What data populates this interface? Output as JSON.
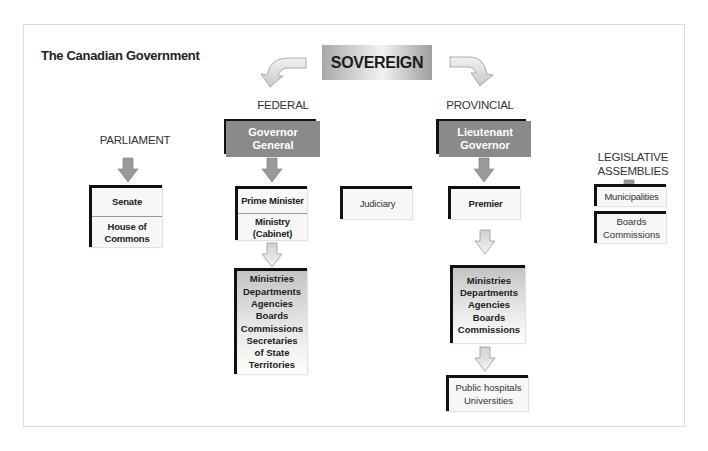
{
  "diagram": {
    "title": "The Canadian Government",
    "top": {
      "label": "SOVEREIGN"
    },
    "branches": {
      "federal": {
        "heading": "FEDERAL",
        "head_box": "Governor General",
        "head_box_lines": [
          "Governor",
          "General"
        ],
        "executive": {
          "top_cell": "Prime Minister",
          "bottom_cell_lines": [
            "Ministry",
            "(Cabinet)"
          ]
        },
        "administration": [
          "Ministries",
          "Departments",
          "Agencies",
          "Boards",
          "Commissions",
          "Secretaries",
          "of State",
          "Territories"
        ]
      },
      "parliament": {
        "heading": "PARLIAMENT",
        "top_cell": "Senate",
        "bottom_cell_lines": [
          "House of",
          "Commons"
        ]
      },
      "judiciary": {
        "label": "Judiciary"
      },
      "provincial": {
        "heading": "PROVINCIAL",
        "head_box_lines": [
          "Lieutenant",
          "Governor"
        ],
        "executive": {
          "label": "Premier"
        },
        "administration": [
          "Ministries",
          "Departments",
          "Agencies",
          "Boards",
          "Commissions"
        ],
        "institutions": [
          "Public hospitals",
          "Universities"
        ]
      },
      "legislative_assemblies": {
        "heading_lines": [
          "LEGISLATIVE",
          "ASSEMBLIES"
        ],
        "items": [
          {
            "lines": [
              "Municipalities"
            ]
          },
          {
            "lines": [
              "Boards",
              "Commissions"
            ]
          }
        ]
      }
    },
    "colors": {
      "gov_box": "#8a8a8a",
      "arrow_fill": "#9a9a9a",
      "arrow_light": "#e0e0e0",
      "box_border": "#111111",
      "frame": "#dcdcdc"
    }
  }
}
